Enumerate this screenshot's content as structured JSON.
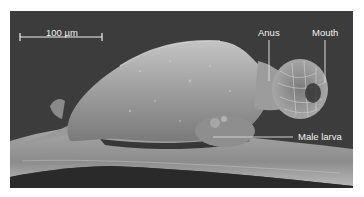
{
  "figure": {
    "type": "scanning electron micrograph",
    "colors": {
      "background": "#3c3c3c",
      "specimen_light": "#b4b4b4",
      "specimen_mid": "#8a8a8a",
      "annotation": "#e8e8e8",
      "margin": "#ffffff"
    },
    "scale_bar": {
      "label": "100 µm"
    },
    "annotations": [
      {
        "id": "anus",
        "label": "Anus"
      },
      {
        "id": "mouth",
        "label": "Mouth"
      },
      {
        "id": "male-larva",
        "label": "Male larva"
      }
    ]
  }
}
